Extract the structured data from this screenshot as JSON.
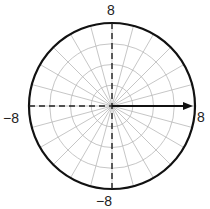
{
  "diagram": {
    "type": "polar-grid",
    "title": "",
    "center": [
      0,
      0
    ],
    "max_radius": 8,
    "ring_radii": [
      2,
      4,
      6,
      8
    ],
    "radial_step_degrees": 15,
    "labels": {
      "top": "8",
      "bottom": "−8",
      "left": "−8",
      "right": "8"
    },
    "vector": {
      "from": [
        0,
        0
      ],
      "to": [
        8,
        0
      ],
      "magnitude": 8,
      "angle_degrees": 0,
      "style": "solid-arrow"
    },
    "dashed_axes": [
      {
        "from": [
          -8,
          0
        ],
        "to": [
          0,
          0
        ]
      },
      {
        "from": [
          0,
          8
        ],
        "to": [
          0,
          -8
        ]
      }
    ],
    "colors": {
      "outer_circle": "#111111",
      "grid": "#b8b8b8",
      "axis_dashed": "#222222",
      "vector": "#111111",
      "label": "#222222"
    }
  }
}
